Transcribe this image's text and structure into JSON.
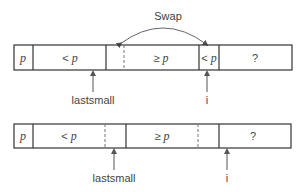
{
  "swap_label": "Swap",
  "top_row": {
    "cells": [
      {
        "text": "p",
        "italic": true
      },
      {
        "prefix": "< ",
        "text": "p"
      },
      {
        "prefix": "≥ ",
        "text": "p"
      },
      {
        "prefix": "< ",
        "text": "p"
      },
      {
        "text": "?"
      }
    ],
    "pointers": [
      {
        "label": "lastsmall"
      },
      {
        "label": "i"
      }
    ]
  },
  "bottom_row": {
    "cells": [
      {
        "text": "p",
        "italic": true
      },
      {
        "prefix": "< ",
        "text": "p"
      },
      {
        "prefix": "≥ ",
        "text": "p"
      },
      {
        "text": "?"
      }
    ],
    "pointers": [
      {
        "label": "lastsmall"
      },
      {
        "label": "i"
      }
    ]
  },
  "colors": {
    "stroke": "#333333",
    "dashed": "#777777",
    "arc": "#666666"
  }
}
